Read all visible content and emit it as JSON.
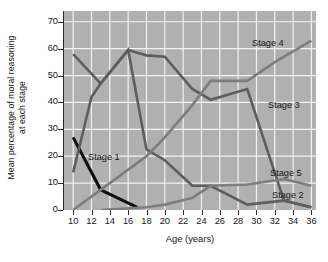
{
  "chart_data": {
    "type": "line",
    "title": "",
    "subtitle": "",
    "xlabel": "Age (years)",
    "ylabel": "Mean percentage of moral reasoning at each stage",
    "ylabel_line1": "Mean percentage of moral reasoning",
    "ylabel_line2": "at each stage",
    "xlim": [
      9,
      36.5
    ],
    "ylim": [
      0,
      74
    ],
    "xticks": [
      10,
      12,
      14,
      16,
      18,
      20,
      22,
      24,
      26,
      28,
      30,
      32,
      34,
      36
    ],
    "yticks": [
      0,
      10,
      20,
      30,
      40,
      50,
      60,
      70
    ],
    "xtick_labels": [
      "10",
      "12",
      "14",
      "16",
      "18",
      "20",
      "22",
      "24",
      "26",
      "28",
      "30",
      "32",
      "34",
      "36"
    ],
    "ytick_labels": [
      "0",
      "10",
      "20",
      "30",
      "40",
      "50",
      "60",
      "70"
    ],
    "grid": true,
    "grid_color": "#f2f2f2",
    "plot_background": "#b0b0b0",
    "figure_background": "#ffffff",
    "legend_position": "inline-annotations",
    "series": [
      {
        "name": "Stage 1",
        "color": "#0f0f0f",
        "linewidth": 3.1,
        "x": [
          10,
          13,
          17
        ],
        "values": [
          27,
          7.5,
          1
        ]
      },
      {
        "name": "Stage 2",
        "color": "#5e5e5e",
        "linewidth": 2.6,
        "x": [
          10,
          13,
          16,
          17,
          18,
          20,
          23,
          25,
          29,
          33,
          36
        ],
        "values": [
          58,
          47,
          59.5,
          58.5,
          57.5,
          57,
          45,
          41,
          45,
          3.5,
          1
        ]
      },
      {
        "name": "Stage 3",
        "color": "#5e5e5e",
        "linewidth": 2.6,
        "x": [
          10,
          12,
          13,
          16,
          18,
          20,
          23,
          25,
          29,
          33,
          36
        ],
        "values": [
          14,
          42,
          47,
          59.5,
          22.5,
          18.5,
          9,
          9,
          2,
          3.5,
          1
        ]
      },
      {
        "name": "Stage 4",
        "color": "#7d7d7d",
        "linewidth": 2.6,
        "x": [
          10,
          13,
          18,
          20,
          23,
          25,
          29,
          32,
          36
        ],
        "values": [
          0,
          7.5,
          20,
          27,
          39,
          48,
          48,
          55,
          63
        ]
      },
      {
        "name": "Stage 5",
        "color": "#7d7d7d",
        "linewidth": 2.6,
        "x": [
          13,
          18,
          20,
          23,
          25,
          29,
          33,
          36
        ],
        "values": [
          0,
          1,
          2,
          4.5,
          9,
          9.5,
          11.5,
          9
        ]
      }
    ],
    "annotations": [
      {
        "text": "Stage 1",
        "x_px": 88,
        "y_px": 152
      },
      {
        "text": "Stage 2",
        "x_px": 272,
        "y_px": 190
      },
      {
        "text": "Stage 3",
        "x_px": 268,
        "y_px": 100
      },
      {
        "text": "Stage 4",
        "x_px": 252,
        "y_px": 38
      },
      {
        "text": "Stage 5",
        "x_px": 270,
        "y_px": 168
      }
    ]
  }
}
